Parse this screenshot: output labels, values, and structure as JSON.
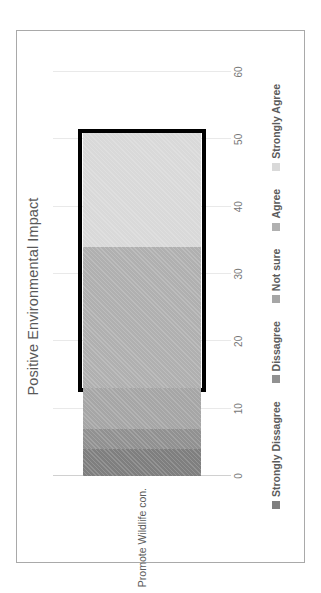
{
  "chart_data": {
    "type": "bar",
    "orientation": "horizontal-stacked",
    "title": "Positive Environmental Impact",
    "xlabel": "",
    "ylabel": "",
    "categories": [
      "Promote Wildlife con."
    ],
    "series": [
      {
        "name": "Strongly Dissagree",
        "values": [
          4
        ],
        "color": "#7f7f7f"
      },
      {
        "name": "Dissagree",
        "values": [
          3
        ],
        "color": "#919191"
      },
      {
        "name": "Not sure",
        "values": [
          6
        ],
        "color": "#a6a6a6"
      },
      {
        "name": "Agree",
        "values": [
          21
        ],
        "color": "#b0b0b0"
      },
      {
        "name": "Strongly Agree",
        "values": [
          17
        ],
        "color": "#d9d9d9"
      }
    ],
    "xlim": [
      0,
      60
    ],
    "xticks": [
      "0",
      "10",
      "20",
      "30",
      "40",
      "50",
      "60"
    ],
    "grid": true,
    "legend_position": "bottom",
    "annotations": [
      {
        "name": "emphasis-rectangle",
        "type": "rectangle-outline",
        "color": "#000000",
        "x_start": 13,
        "x_end": 51
      }
    ]
  },
  "axis": {
    "ticks": [
      {
        "label": "0",
        "value": 0
      },
      {
        "label": "10",
        "value": 10
      },
      {
        "label": "20",
        "value": 20
      },
      {
        "label": "30",
        "value": 30
      },
      {
        "label": "40",
        "value": 40
      },
      {
        "label": "50",
        "value": 50
      },
      {
        "label": "60",
        "value": 60
      }
    ]
  },
  "legend": {
    "items": [
      {
        "label": "Strongly Dissagree",
        "color": "#7f7f7f"
      },
      {
        "label": "Dissagree",
        "color": "#919191"
      },
      {
        "label": "Not sure",
        "color": "#a6a6a6"
      },
      {
        "label": "Agree",
        "color": "#b0b0b0"
      },
      {
        "label": "Strongly Agree",
        "color": "#d9d9d9"
      }
    ]
  },
  "colors": {
    "frame_border": "#a9a9a9",
    "gridline": "#e9e9e9",
    "title_text": "#595959",
    "tick_text": "#777777",
    "label_text": "#5b5b5b",
    "highlight": "#000000",
    "background": "#ffffff"
  }
}
